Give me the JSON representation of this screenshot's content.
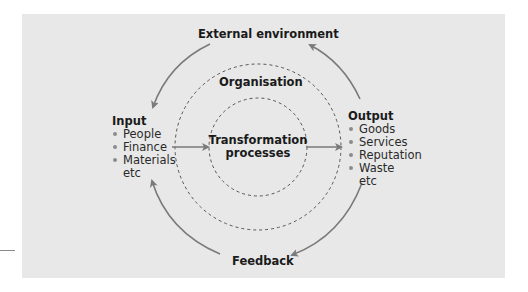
{
  "diagram": {
    "external_environment": "External environment",
    "organisation": "Organisation",
    "transformation": {
      "line1": "Transformation",
      "line2": "processes"
    },
    "feedback": "Feedback",
    "input": {
      "title": "Input",
      "items": [
        "People",
        "Finance",
        "Materials"
      ],
      "etc": "etc"
    },
    "output": {
      "title": "Output",
      "items": [
        "Goods",
        "Services",
        "Reputation",
        "Waste"
      ],
      "etc": "etc"
    },
    "colors": {
      "background": "#e8e8e8",
      "arrow": "#7a7a7a",
      "dashed_circle": "#555555",
      "bullet": "#8c8c8c",
      "text": "#1a1a1a"
    }
  }
}
